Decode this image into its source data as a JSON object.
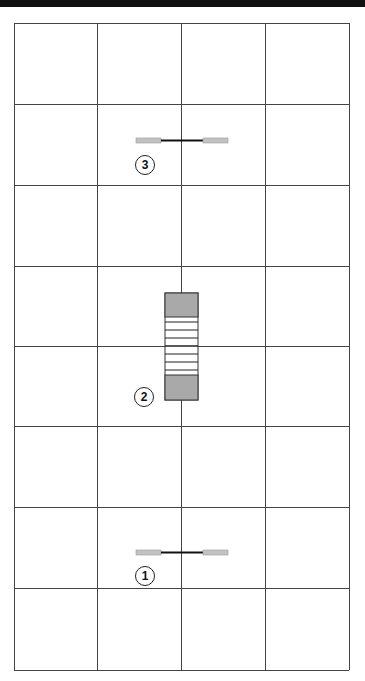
{
  "diagram": {
    "grid": {
      "columns": 4,
      "rows": 8,
      "x_lines": [
        14,
        97,
        181,
        265,
        349
      ],
      "y_lines": [
        23,
        104,
        185,
        266,
        346,
        426,
        507,
        588,
        670
      ],
      "line_color": "#444444"
    },
    "components": [
      {
        "id": "component-1",
        "label": "1",
        "type": "horizontal-connector",
        "center_x": 181,
        "center_y": 552
      },
      {
        "id": "component-2",
        "label": "2",
        "type": "vertical-striped-block",
        "x": 165,
        "y": 293,
        "width": 33,
        "height": 107
      },
      {
        "id": "component-3",
        "label": "3",
        "type": "horizontal-connector",
        "center_x": 181,
        "center_y": 140
      }
    ],
    "colors": {
      "gray_fill": "#a9a9a9",
      "light_gray_tab": "#c2c2c2",
      "dark_line": "#111111"
    }
  }
}
